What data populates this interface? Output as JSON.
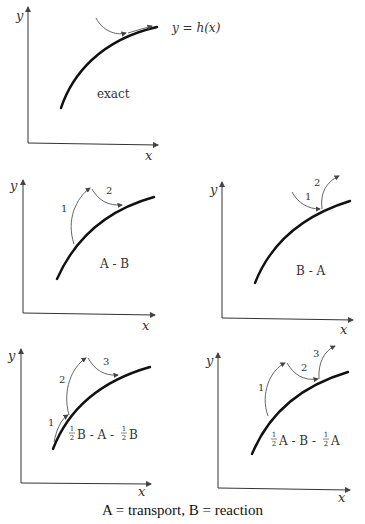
{
  "panels": [
    {
      "id": "exact",
      "label": "exact",
      "curve_label": "y = h(x)",
      "axis_x": "x",
      "axis_y": "y",
      "steps": []
    },
    {
      "id": "A-B",
      "label": "A - B",
      "axis_x": "x",
      "axis_y": "y",
      "steps": [
        "1",
        "2"
      ]
    },
    {
      "id": "B-A",
      "label": "B - A",
      "axis_x": "x",
      "axis_y": "y",
      "steps": [
        "1",
        "2"
      ]
    },
    {
      "id": "halfB-A-halfB",
      "label_parts": [
        "1",
        "2",
        "B - A - ",
        "1",
        "2",
        "B"
      ],
      "axis_x": "x",
      "axis_y": "y",
      "steps": [
        "1",
        "2",
        "3"
      ]
    },
    {
      "id": "halfA-B-halfA",
      "label_parts": [
        "1",
        "2",
        "A - B - ",
        "1",
        "2",
        "A"
      ],
      "axis_x": "x",
      "axis_y": "y",
      "steps": [
        "1",
        "2",
        "3"
      ]
    }
  ],
  "caption": "A = transport, B = reaction"
}
